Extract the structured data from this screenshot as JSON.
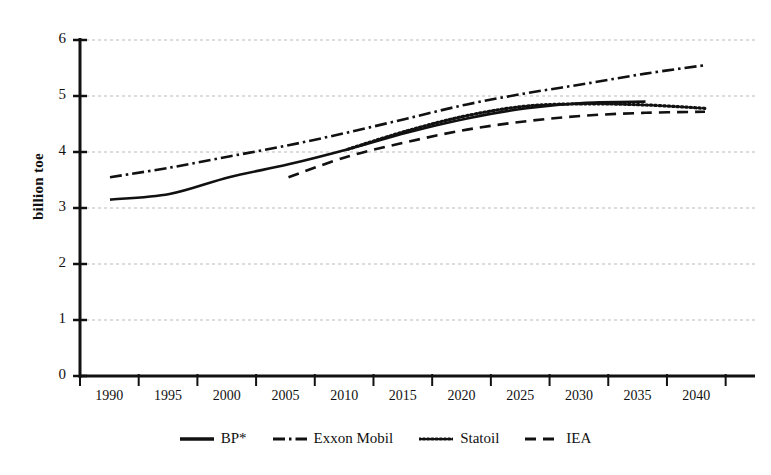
{
  "chart_data": {
    "type": "line",
    "title": "",
    "xlabel": "",
    "ylabel": "billion toe",
    "xlim": [
      1990,
      2040
    ],
    "ylim": [
      0,
      6
    ],
    "grid": true,
    "legend_position": "bottom",
    "x_ticks": [
      "1990",
      "1995",
      "2000",
      "2005",
      "2010",
      "2015",
      "2020",
      "2025",
      "2030",
      "2035",
      "2040"
    ],
    "y_ticks": [
      "0",
      "1",
      "2",
      "3",
      "4",
      "5",
      "6"
    ],
    "series": [
      {
        "name": "BP*",
        "style": "solid",
        "x": [
          1990,
          1995,
          2000,
          2005,
          2010,
          2015,
          2020,
          2025,
          2030,
          2035
        ],
        "values": [
          3.15,
          3.25,
          3.55,
          3.78,
          4.05,
          4.35,
          4.6,
          4.78,
          4.88,
          4.9
        ]
      },
      {
        "name": "Exxon Mobil",
        "style": "dash-dot",
        "x": [
          1990,
          1995,
          2000,
          2005,
          2010,
          2015,
          2020,
          2025,
          2030,
          2035,
          2040
        ],
        "values": [
          3.55,
          3.72,
          3.92,
          4.12,
          4.35,
          4.6,
          4.85,
          5.05,
          5.22,
          5.4,
          5.55
        ]
      },
      {
        "name": "Statoil",
        "style": "dotted",
        "x": [
          2010,
          2015,
          2020,
          2025,
          2030,
          2035,
          2040
        ],
        "values": [
          4.05,
          4.38,
          4.65,
          4.82,
          4.86,
          4.84,
          4.78
        ]
      },
      {
        "name": "IEA",
        "style": "dashed",
        "x": [
          2005,
          2010,
          2015,
          2020,
          2025,
          2030,
          2035,
          2040
        ],
        "values": [
          3.55,
          3.92,
          4.18,
          4.4,
          4.55,
          4.65,
          4.7,
          4.72
        ]
      }
    ]
  },
  "axis": {
    "y_label": "billion toe",
    "y_ticks": [
      "6",
      "5",
      "4",
      "3",
      "2",
      "1",
      "0"
    ],
    "x_ticks": [
      "1990",
      "1995",
      "2000",
      "2005",
      "2010",
      "2015",
      "2020",
      "2025",
      "2030",
      "2035",
      "2040"
    ]
  },
  "legend": {
    "items": [
      {
        "label": "BP*",
        "style": "solid"
      },
      {
        "label": "Exxon Mobil",
        "style": "dash-dot"
      },
      {
        "label": "Statoil",
        "style": "dotted"
      },
      {
        "label": "IEA",
        "style": "dashed"
      }
    ]
  },
  "colors": {
    "line": "#111111",
    "grid": "#b9b9b9",
    "axis": "#111111",
    "background": "#ffffff"
  }
}
